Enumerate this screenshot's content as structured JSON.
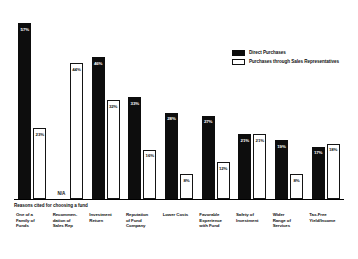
{
  "chart": {
    "subtitle": "Reasons cited for choosing a fund",
    "na_text": "N/A"
  },
  "legend": {
    "position": "top-right",
    "items": [
      {
        "label": "Direct Purchases",
        "swatch": "filled-black-swatch-icon",
        "color": "#0d0d0d"
      },
      {
        "label": "Purchases through Sales Representatives",
        "swatch": "outlined-white-swatch-icon",
        "color": "#ffffff"
      }
    ]
  },
  "chart_data": {
    "type": "bar",
    "title": "",
    "subtitle": "Reasons cited for choosing a fund",
    "xlabel": "",
    "ylabel": "",
    "ylim": [
      0,
      60
    ],
    "grid": false,
    "legend_position": "top-right",
    "categories": [
      "One of a Family of Funds",
      "Recommendation of Sales Rep",
      "Investment Return",
      "Reputation of Fund Company",
      "Lower Costs",
      "Favorable Experience with Fund",
      "Safety of Investment",
      "Wider Range of Services",
      "Tax-Free Yield/Income"
    ],
    "series": [
      {
        "name": "Direct Purchases",
        "color": "#0d0d0d",
        "values": [
          57,
          null,
          46,
          33,
          28,
          27,
          21,
          19,
          17
        ],
        "labels": [
          "57%",
          "N/A",
          "46%",
          "33%",
          "28%",
          "27%",
          "21%",
          "19%",
          "17%"
        ]
      },
      {
        "name": "Purchases through Sales Representatives",
        "color": "#ffffff",
        "values": [
          23,
          44,
          32,
          16,
          8,
          12,
          21,
          8,
          18
        ],
        "labels": [
          "23%",
          "44%",
          "32%",
          "16%",
          "8%",
          "12%",
          "21%",
          "8%",
          "18%"
        ]
      }
    ]
  },
  "categories_lines": [
    [
      "One of a",
      "Family of",
      "Funds"
    ],
    [
      "Recommen-",
      "dation of",
      "Sales Rep"
    ],
    [
      "Investment",
      "Return"
    ],
    [
      "Reputation",
      "of Fund",
      "Company"
    ],
    [
      "Lower Costs"
    ],
    [
      "Favorable",
      "Experience",
      "with Fund"
    ],
    [
      "Safety of",
      "Investment"
    ],
    [
      "Wider",
      "Range of",
      "Services"
    ],
    [
      "Tax-Free",
      "Yield/Income"
    ]
  ]
}
